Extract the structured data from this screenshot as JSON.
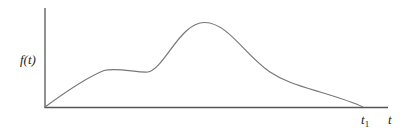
{
  "diagram": {
    "y_label": "f(t)",
    "x_label": "t",
    "end_marker": "t",
    "end_marker_subscript": "1",
    "curve_color": "#777777",
    "axis_color": "#555555",
    "curve_points": [
      [
        45,
        107
      ],
      [
        75,
        88
      ],
      [
        105,
        70
      ],
      [
        125,
        70
      ],
      [
        148,
        72
      ],
      [
        170,
        52
      ],
      [
        205,
        22
      ],
      [
        235,
        35
      ],
      [
        270,
        70
      ],
      [
        300,
        86
      ],
      [
        340,
        98
      ],
      [
        363,
        107
      ]
    ]
  }
}
